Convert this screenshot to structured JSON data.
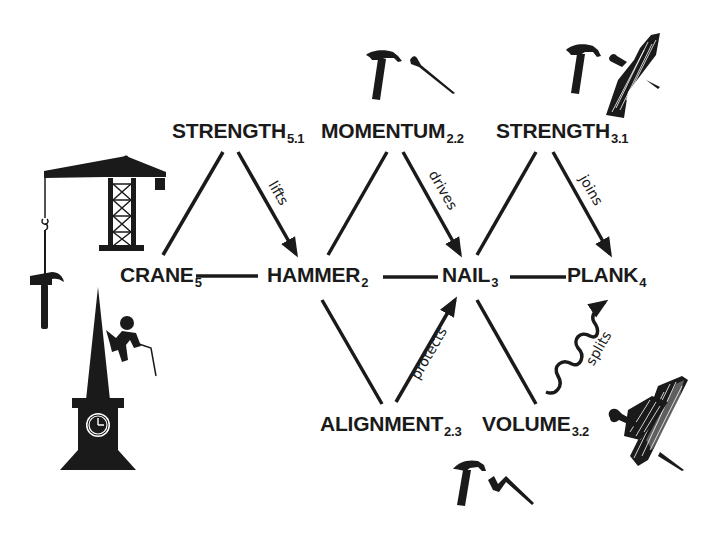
{
  "diagram": {
    "type": "concept-relation-graph",
    "nodes": [
      {
        "id": "crane",
        "label": "CRANE",
        "sub": "5",
        "x": 120,
        "y": 262
      },
      {
        "id": "strength51",
        "label": "STRENGTH",
        "sub": "5.1",
        "x": 172,
        "y": 120
      },
      {
        "id": "hammer",
        "label": "HAMMER",
        "sub": "2",
        "x": 268,
        "y": 264
      },
      {
        "id": "momentum",
        "label": "MOMENTUM",
        "sub": "2.2",
        "x": 322,
        "y": 120
      },
      {
        "id": "alignment",
        "label": "ALIGNMENT",
        "sub": "2.3",
        "x": 320,
        "y": 413
      },
      {
        "id": "nail",
        "label": "NAIL",
        "sub": "3",
        "x": 442,
        "y": 264
      },
      {
        "id": "strength31",
        "label": "STRENGTH",
        "sub": "3.1",
        "x": 497,
        "y": 120
      },
      {
        "id": "volume",
        "label": "VOLUME",
        "sub": "3.2",
        "x": 482,
        "y": 413
      },
      {
        "id": "plank",
        "label": "PLANK",
        "sub": "4",
        "x": 566,
        "y": 264
      }
    ],
    "edges": [
      {
        "from": "crane",
        "to": "strength51",
        "style": "line"
      },
      {
        "from": "crane",
        "to": "hammer",
        "style": "line"
      },
      {
        "from": "strength51",
        "to": "hammer",
        "style": "arrow",
        "label": "lifts"
      },
      {
        "from": "hammer",
        "to": "momentum",
        "style": "line"
      },
      {
        "from": "hammer",
        "to": "nail",
        "style": "line"
      },
      {
        "from": "hammer",
        "to": "alignment",
        "style": "line"
      },
      {
        "from": "momentum",
        "to": "nail",
        "style": "arrow",
        "label": "drives"
      },
      {
        "from": "alignment",
        "to": "nail",
        "style": "arrow",
        "label": "protects"
      },
      {
        "from": "nail",
        "to": "strength31",
        "style": "line"
      },
      {
        "from": "nail",
        "to": "plank",
        "style": "line"
      },
      {
        "from": "nail",
        "to": "volume",
        "style": "line"
      },
      {
        "from": "strength31",
        "to": "plank",
        "style": "arrow",
        "label": "joins"
      },
      {
        "from": "volume",
        "to": "plank",
        "style": "wavy-arrow",
        "label": "splits"
      }
    ],
    "edge_labels": {
      "lifts": "lifts",
      "drives": "drives",
      "protects": "protects",
      "joins": "joins",
      "splits": "splits"
    },
    "illustrations": [
      {
        "name": "tower-crane-icon",
        "position": "left, near CRANE"
      },
      {
        "name": "hanging-hammer-icon",
        "position": "left, hanging from crane hook"
      },
      {
        "name": "clock-tower-climber-icon",
        "position": "bottom left"
      },
      {
        "name": "hammer-and-nail-icon",
        "position": "above MOMENTUM"
      },
      {
        "name": "hammer-nail-plank-icon",
        "position": "above STRENGTH 3.1"
      },
      {
        "name": "split-plank-with-nail-icon",
        "position": "right of VOLUME"
      },
      {
        "name": "hammer-and-bent-nail-icon",
        "position": "below ALIGNMENT/VOLUME"
      }
    ],
    "colors": {
      "ink": "#1a1a1a",
      "background": "#ffffff"
    }
  }
}
